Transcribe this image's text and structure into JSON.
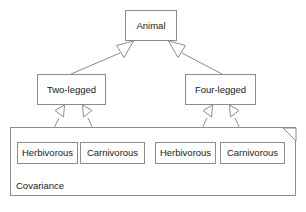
{
  "diagram": {
    "type": "uml-class-diagram",
    "canvas": {
      "width": 306,
      "height": 212,
      "background": "#ffffff"
    },
    "style": {
      "border_color": "#8c8c8c",
      "line_color": "#8c8c8c",
      "text_color": "#1a1a1a",
      "node_fill": "#ffffff"
    },
    "nodes": {
      "animal": {
        "label": "Animal",
        "x": 125,
        "y": 10,
        "w": 52,
        "h": 31
      },
      "two_legged": {
        "label": "Two-legged",
        "x": 37,
        "y": 74,
        "w": 69,
        "h": 31
      },
      "four_legged": {
        "label": "Four-legged",
        "x": 185,
        "y": 74,
        "w": 71,
        "h": 31
      },
      "herbivorous_left": {
        "label": "Herbivorous",
        "x": 17,
        "y": 142,
        "w": 61,
        "h": 22
      },
      "carnivorous_left": {
        "label": "Carnivorous",
        "x": 80,
        "y": 142,
        "w": 65,
        "h": 22
      },
      "herbivorous_right": {
        "label": "Herbivorous",
        "x": 155,
        "y": 142,
        "w": 61,
        "h": 22
      },
      "carnivorous_right": {
        "label": "Carnivorous",
        "x": 220,
        "y": 142,
        "w": 65,
        "h": 22
      }
    },
    "package": {
      "label": "Covariance",
      "x": 10,
      "y": 127,
      "w": 286,
      "h": 69,
      "fold_size": 11,
      "label_x": 16,
      "label_y": 181
    },
    "edges": [
      {
        "name": "two-legged-to-animal",
        "kind": "generalization",
        "from": "two_legged",
        "to": "animal"
      },
      {
        "name": "four-legged-to-animal",
        "kind": "generalization",
        "from": "four_legged",
        "to": "animal"
      },
      {
        "name": "herbivorous-left-to-two-legged",
        "kind": "generalization",
        "from": "herbivorous_left",
        "to": "two_legged"
      },
      {
        "name": "carnivorous-left-to-two-legged",
        "kind": "generalization",
        "from": "carnivorous_left",
        "to": "two_legged"
      },
      {
        "name": "herbivorous-right-to-four-legged",
        "kind": "generalization",
        "from": "herbivorous_right",
        "to": "four_legged"
      },
      {
        "name": "carnivorous-right-to-four-legged",
        "kind": "generalization",
        "from": "carnivorous_right",
        "to": "four_legged"
      }
    ]
  }
}
